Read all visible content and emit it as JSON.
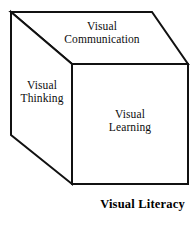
{
  "figure": {
    "caption": "Visual Literacy",
    "shape": "cube",
    "stroke_color": "#111111",
    "fill_color": "#ffffff",
    "faces": {
      "top": {
        "name": "visual-communication",
        "line1": "Visual",
        "line2": "Communication"
      },
      "left": {
        "name": "visual-thinking",
        "line1": "Visual",
        "line2": "Thinking"
      },
      "front": {
        "name": "visual-learning",
        "line1": "Visual",
        "line2": "Learning"
      }
    },
    "geometry": {
      "back_top_left": [
        11,
        12
      ],
      "back_top_right": [
        152,
        12
      ],
      "back_bottom_left": [
        11,
        135
      ],
      "front_top_left": [
        72,
        64
      ],
      "front_top_right": [
        188,
        64
      ],
      "front_bottom_left": [
        72,
        184
      ],
      "front_bottom_right": [
        188,
        184
      ]
    }
  }
}
